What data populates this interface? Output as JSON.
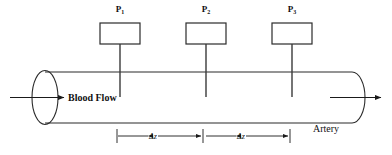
{
  "figure": {
    "background_color": "#ffffff",
    "line_color": "#1a1a1a",
    "tube_color": "#2b2b2b",
    "stem_color": "#3a3a3a"
  },
  "gauges": [
    {
      "id": "gauge-1",
      "label_base": "P",
      "label_sub": "1",
      "label_full": "P1"
    },
    {
      "id": "gauge-2",
      "label_base": "P",
      "label_sub": "2",
      "label_full": "P2"
    },
    {
      "id": "gauge-3",
      "label_base": "P",
      "label_sub": "3",
      "label_full": "P3"
    }
  ],
  "labels": {
    "blood_flow": "Blood Flow",
    "artery": "Artery"
  },
  "dimensions": [
    {
      "id": "span-1",
      "label": "Δz"
    },
    {
      "id": "span-2",
      "label": "Δz"
    }
  ]
}
